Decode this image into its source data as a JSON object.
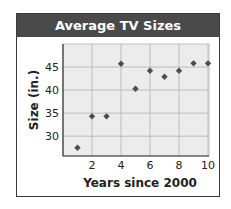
{
  "header": {
    "title": "Average TV Sizes"
  },
  "colors": {
    "header_bg": "#4a4a4a",
    "plot_bg": "#ececec",
    "grid": "#bdbdbd",
    "marker": "#4d4d4d"
  },
  "chart_data": {
    "type": "scatter",
    "title": "Average TV Sizes",
    "xlabel": "Years since 2000",
    "ylabel": "Size (in.)",
    "xlim": [
      0,
      10
    ],
    "ylim": [
      25.7,
      50
    ],
    "xticks": [
      2,
      4,
      6,
      8,
      10
    ],
    "yticks": [
      30,
      35,
      40,
      45
    ],
    "grid": true,
    "legend": null,
    "x": [
      1,
      2,
      3,
      4,
      5,
      6,
      7,
      8,
      9,
      10
    ],
    "y": [
      27.5,
      34.3,
      34.3,
      45.7,
      40.3,
      44.2,
      42.9,
      44.2,
      45.8,
      45.8
    ]
  }
}
